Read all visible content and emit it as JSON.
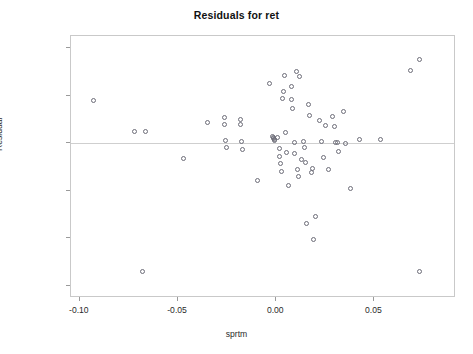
{
  "chart_data": {
    "type": "scatter",
    "title": "Residuals for ret",
    "xlabel": "sprtm",
    "ylabel": "Residual",
    "xlim": [
      -0.1045,
      0.0915
    ],
    "ylim": [
      -0.1628,
      0.1128
    ],
    "xticks": [
      -0.1,
      -0.05,
      0.0,
      0.05
    ],
    "xtick_labels": [
      "-0.10",
      "-0.05",
      "0.00",
      "0.05"
    ],
    "yticks": [
      0.1,
      0.05,
      0.0,
      -0.05,
      -0.1,
      -0.15
    ],
    "ytick_labels": [
      "0.10",
      "0.05",
      "0.00",
      "-0.05",
      "-0.10",
      "-0.15"
    ],
    "grid": false,
    "legend": null,
    "reference_line": {
      "axis": "y",
      "value": 0.0,
      "color": "#cfcfcf"
    },
    "marker": {
      "shape": "circle",
      "filled": false,
      "edge_color": "#6d6d78",
      "size": 5
    },
    "series": [
      {
        "name": "residuals",
        "points": [
          [
            -0.093,
            0.0448
          ],
          [
            -0.068,
            -0.1353
          ],
          [
            -0.0722,
            0.012
          ],
          [
            -0.0668,
            0.012
          ],
          [
            -0.047,
            -0.0158
          ],
          [
            -0.0352,
            0.0221
          ],
          [
            -0.0262,
            0.0268
          ],
          [
            -0.0262,
            0.0202
          ],
          [
            -0.0258,
            0.0028
          ],
          [
            -0.0252,
            -0.0042
          ],
          [
            -0.018,
            0.0252
          ],
          [
            -0.018,
            0.0192
          ],
          [
            -0.0175,
            0.0019
          ],
          [
            -0.0172,
            -0.0061
          ],
          [
            -0.0095,
            -0.0387
          ],
          [
            -0.0036,
            0.0626
          ],
          [
            -0.002,
            0.0069
          ],
          [
            -0.0016,
            0.006
          ],
          [
            -0.0013,
            0.0051
          ],
          [
            -0.001,
            0.0042
          ],
          [
            -0.0007,
            0.0034
          ],
          [
            0.0005,
            0.0063
          ],
          [
            0.0014,
            -0.0051
          ],
          [
            0.0018,
            -0.0139
          ],
          [
            0.0022,
            -0.0215
          ],
          [
            0.0025,
            -0.0302
          ],
          [
            0.003,
            0.0467
          ],
          [
            0.0038,
            0.0548
          ],
          [
            0.0042,
            0.0709
          ],
          [
            0.0048,
            0.0116
          ],
          [
            0.0052,
            -0.0094
          ],
          [
            0.006,
            -0.0444
          ],
          [
            0.0076,
            0.0592
          ],
          [
            0.008,
            0.0462
          ],
          [
            0.0085,
            0.0365
          ],
          [
            0.0092,
            0.001
          ],
          [
            0.0095,
            -0.0108
          ],
          [
            0.0102,
            0.075
          ],
          [
            0.0108,
            -0.0275
          ],
          [
            0.0112,
            -0.0348
          ],
          [
            0.0118,
            0.07
          ],
          [
            0.013,
            -0.0176
          ],
          [
            0.0138,
            0.0015
          ],
          [
            0.0142,
            -0.0043
          ],
          [
            0.0148,
            -0.0205
          ],
          [
            0.0155,
            -0.0848
          ],
          [
            0.0162,
            0.0408
          ],
          [
            0.017,
            0.0295
          ],
          [
            0.0178,
            -0.031
          ],
          [
            0.0182,
            -0.0262
          ],
          [
            0.019,
            -0.101
          ],
          [
            0.02,
            -0.0772
          ],
          [
            0.0218,
            0.0238
          ],
          [
            0.0232,
            0.0016
          ],
          [
            0.024,
            -0.0145
          ],
          [
            0.0252,
            0.0188
          ],
          [
            0.0268,
            -0.0278
          ],
          [
            0.0288,
            0.0286
          ],
          [
            0.0295,
            0.0175
          ],
          [
            0.0302,
            0.0004
          ],
          [
            0.031,
            0.0004
          ],
          [
            0.0318,
            -0.0082
          ],
          [
            0.034,
            0.0332
          ],
          [
            0.0352,
            0.0002
          ],
          [
            0.0378,
            -0.0472
          ],
          [
            0.0425,
            0.0038
          ],
          [
            0.053,
            0.004
          ],
          [
            0.0682,
            0.0768
          ],
          [
            0.0728,
            0.088
          ],
          [
            0.073,
            -0.1352
          ]
        ]
      }
    ]
  }
}
